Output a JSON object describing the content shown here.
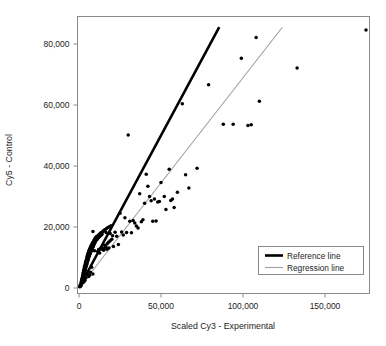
{
  "chart_data": {
    "type": "scatter",
    "title": "",
    "xlabel": "Scaled Cy3 - Experimental",
    "ylabel": "Cy5 - Control",
    "xlim": [
      -4000,
      178000
    ],
    "ylim": [
      -2500,
      88000
    ],
    "xticks": [
      0,
      50000,
      100000,
      150000
    ],
    "xticklabels": [
      "0",
      "50,000",
      "100,000",
      "150,000"
    ],
    "yticks": [
      0,
      20000,
      40000,
      60000,
      80000
    ],
    "yticklabels": [
      "0",
      "20,000",
      "40,000",
      "60,000",
      "80,000"
    ],
    "grid": false,
    "legend_position": "lower right",
    "legend": [
      {
        "label": "Reference line",
        "color": "#000000",
        "width": 2.6
      },
      {
        "label": "Regression line",
        "color": "#a0a0a0",
        "width": 1.1
      }
    ],
    "series": [
      {
        "name": "points",
        "type": "scatter",
        "marker": "filled-circle",
        "color": "#000000",
        "points": [
          [
            500,
            400
          ],
          [
            700,
            900
          ],
          [
            900,
            600
          ],
          [
            1100,
            1500
          ],
          [
            1200,
            800
          ],
          [
            1400,
            2100
          ],
          [
            1500,
            1200
          ],
          [
            1600,
            2600
          ],
          [
            1700,
            1800
          ],
          [
            1800,
            3000
          ],
          [
            1900,
            2200
          ],
          [
            2000,
            3400
          ],
          [
            2100,
            2700
          ],
          [
            2200,
            4000
          ],
          [
            2300,
            3100
          ],
          [
            2400,
            4600
          ],
          [
            2500,
            3500
          ],
          [
            2600,
            5100
          ],
          [
            2700,
            3900
          ],
          [
            2800,
            5600
          ],
          [
            2900,
            4300
          ],
          [
            3000,
            6100
          ],
          [
            3100,
            4700
          ],
          [
            3200,
            6600
          ],
          [
            3300,
            5000
          ],
          [
            3400,
            7000
          ],
          [
            3500,
            5400
          ],
          [
            3600,
            7400
          ],
          [
            3700,
            5800
          ],
          [
            3800,
            7900
          ],
          [
            3900,
            6200
          ],
          [
            4000,
            8300
          ],
          [
            4100,
            6600
          ],
          [
            4200,
            8700
          ],
          [
            4300,
            7000
          ],
          [
            4400,
            9100
          ],
          [
            4500,
            7400
          ],
          [
            4600,
            9500
          ],
          [
            4700,
            7800
          ],
          [
            4800,
            9900
          ],
          [
            4900,
            8200
          ],
          [
            5000,
            10300
          ],
          [
            5100,
            8500
          ],
          [
            5200,
            10700
          ],
          [
            5300,
            8900
          ],
          [
            5400,
            11000
          ],
          [
            5500,
            9200
          ],
          [
            5600,
            11400
          ],
          [
            5700,
            9600
          ],
          [
            5800,
            11700
          ],
          [
            5900,
            3800
          ],
          [
            6000,
            12000
          ],
          [
            6100,
            10200
          ],
          [
            6200,
            12300
          ],
          [
            6300,
            10500
          ],
          [
            6400,
            12600
          ],
          [
            6500,
            4200
          ],
          [
            6600,
            11000
          ],
          [
            6700,
            12900
          ],
          [
            6800,
            11300
          ],
          [
            6900,
            13200
          ],
          [
            7000,
            11600
          ],
          [
            7100,
            13400
          ],
          [
            7200,
            11900
          ],
          [
            7300,
            13700
          ],
          [
            7400,
            12100
          ],
          [
            7500,
            14000
          ],
          [
            7600,
            12400
          ],
          [
            7700,
            6800
          ],
          [
            7800,
            12700
          ],
          [
            7900,
            14300
          ],
          [
            8000,
            12900
          ],
          [
            8100,
            14500
          ],
          [
            8200,
            13200
          ],
          [
            8300,
            14800
          ],
          [
            8400,
            13400
          ],
          [
            8500,
            4600
          ],
          [
            8600,
            13700
          ],
          [
            8700,
            15000
          ],
          [
            8800,
            13900
          ],
          [
            8900,
            15200
          ],
          [
            9000,
            14200
          ],
          [
            9100,
            15400
          ],
          [
            9200,
            14400
          ],
          [
            9300,
            15700
          ],
          [
            9400,
            14700
          ],
          [
            9500,
            15900
          ],
          [
            9600,
            14900
          ],
          [
            9700,
            16100
          ],
          [
            9800,
            15100
          ],
          [
            9900,
            16300
          ],
          [
            10000,
            15400
          ],
          [
            10200,
            16500
          ],
          [
            10400,
            15600
          ],
          [
            10600,
            16800
          ],
          [
            10800,
            15900
          ],
          [
            11000,
            17000
          ],
          [
            11200,
            16100
          ],
          [
            11400,
            12000
          ],
          [
            11600,
            16400
          ],
          [
            11800,
            17300
          ],
          [
            12000,
            16600
          ],
          [
            12200,
            17500
          ],
          [
            12400,
            16800
          ],
          [
            12600,
            11500
          ],
          [
            12800,
            17800
          ],
          [
            13000,
            17100
          ],
          [
            13200,
            18000
          ],
          [
            13400,
            17300
          ],
          [
            13600,
            12800
          ],
          [
            13800,
            18200
          ],
          [
            14000,
            17600
          ],
          [
            14200,
            18400
          ],
          [
            14500,
            13000
          ],
          [
            14800,
            18700
          ],
          [
            15000,
            12400
          ],
          [
            15300,
            18900
          ],
          [
            15600,
            14000
          ],
          [
            16000,
            19200
          ],
          [
            16400,
            13500
          ],
          [
            16800,
            19500
          ],
          [
            17200,
            14500
          ],
          [
            17600,
            19800
          ],
          [
            18000,
            15000
          ],
          [
            18500,
            20100
          ],
          [
            19000,
            15500
          ],
          [
            19500,
            20400
          ],
          [
            20000,
            16000
          ],
          [
            8500,
            18500
          ],
          [
            9500,
            12200
          ],
          [
            7000,
            5200
          ],
          [
            5500,
            4500
          ],
          [
            4200,
            3300
          ],
          [
            3600,
            2500
          ],
          [
            2800,
            1900
          ],
          [
            12000,
            12600
          ],
          [
            13500,
            13200
          ],
          [
            15500,
            12900
          ],
          [
            17000,
            12700
          ],
          [
            16500,
            18200
          ],
          [
            18200,
            13100
          ],
          [
            19000,
            17900
          ],
          [
            20500,
            17100
          ],
          [
            21000,
            13600
          ],
          [
            22000,
            18300
          ],
          [
            23000,
            17000
          ],
          [
            24000,
            14300
          ],
          [
            25000,
            24500
          ],
          [
            26000,
            18400
          ],
          [
            27000,
            17400
          ],
          [
            28000,
            23000
          ],
          [
            29000,
            18200
          ],
          [
            30000,
            50200
          ],
          [
            31000,
            21900
          ],
          [
            32000,
            18100
          ],
          [
            33000,
            22100
          ],
          [
            34000,
            21300
          ],
          [
            35000,
            20300
          ],
          [
            36000,
            19700
          ],
          [
            37000,
            30900
          ],
          [
            38000,
            21700
          ],
          [
            39000,
            22400
          ],
          [
            40000,
            27800
          ],
          [
            41000,
            37300
          ],
          [
            42000,
            33400
          ],
          [
            43000,
            30000
          ],
          [
            44000,
            28600
          ],
          [
            45000,
            21900
          ],
          [
            46000,
            29200
          ],
          [
            47000,
            22000
          ],
          [
            48000,
            28200
          ],
          [
            49000,
            28400
          ],
          [
            50000,
            34600
          ],
          [
            52000,
            30000
          ],
          [
            53000,
            25700
          ],
          [
            55000,
            38900
          ],
          [
            56000,
            28700
          ],
          [
            57000,
            29200
          ],
          [
            58000,
            26400
          ],
          [
            60000,
            31400
          ],
          [
            63000,
            60400
          ],
          [
            65000,
            37100
          ],
          [
            67000,
            32800
          ],
          [
            72000,
            39300
          ],
          [
            79000,
            66600
          ],
          [
            88000,
            53700
          ],
          [
            94000,
            53700
          ],
          [
            99000,
            75300
          ],
          [
            103000,
            53300
          ],
          [
            105000,
            53500
          ],
          [
            108000,
            82100
          ],
          [
            110000,
            61200
          ],
          [
            133000,
            72100
          ],
          [
            175000,
            84600
          ]
        ]
      }
    ],
    "lines": [
      {
        "name": "Reference line",
        "color": "#000000",
        "width": 2.6,
        "slope": 1.0,
        "intercept": 0,
        "from": [
          0,
          0
        ],
        "to": [
          85500,
          85500
        ]
      },
      {
        "name": "Regression line",
        "color": "#a0a0a0",
        "width": 1.1,
        "slope": 0.689,
        "intercept": 0,
        "from": [
          0,
          0
        ],
        "to": [
          124000,
          85500
        ]
      }
    ]
  }
}
